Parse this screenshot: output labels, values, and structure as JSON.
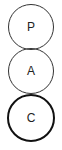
{
  "nodes": [
    {
      "label": "P",
      "active": false
    },
    {
      "label": "A",
      "active": false
    },
    {
      "label": "C",
      "active": true
    }
  ]
}
